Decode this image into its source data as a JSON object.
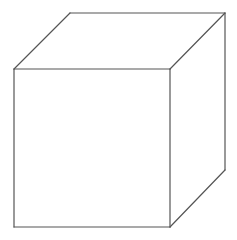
{
  "diagram": {
    "type": "wireframe-cube",
    "canvas": {
      "width": 237,
      "height": 240,
      "background": "#ffffff"
    },
    "stroke_color": "#555555",
    "vertices": {
      "front_top_left": [
        14,
        69
      ],
      "front_top_right": [
        170,
        69
      ],
      "front_bottom_left": [
        14,
        227
      ],
      "front_bottom_right": [
        170,
        227
      ],
      "back_top_left": [
        70,
        13
      ],
      "back_top_right": [
        225,
        13
      ],
      "back_bottom_right": [
        225,
        170
      ]
    },
    "edges": [
      {
        "name": "front-top",
        "from": "front_top_left",
        "to": "front_top_right"
      },
      {
        "name": "front-bottom",
        "from": "front_bottom_left",
        "to": "front_bottom_right"
      },
      {
        "name": "front-left",
        "from": "front_top_left",
        "to": "front_bottom_left"
      },
      {
        "name": "front-right",
        "from": "front_top_right",
        "to": "front_bottom_right"
      },
      {
        "name": "back-top",
        "from": "back_top_left",
        "to": "back_top_right"
      },
      {
        "name": "back-right",
        "from": "back_top_right",
        "to": "back_bottom_right"
      },
      {
        "name": "depth-top-left",
        "from": "front_top_left",
        "to": "back_top_left"
      },
      {
        "name": "depth-top-right",
        "from": "front_top_right",
        "to": "back_top_right"
      },
      {
        "name": "depth-bottom-right",
        "from": "front_bottom_right",
        "to": "back_bottom_right"
      }
    ]
  }
}
